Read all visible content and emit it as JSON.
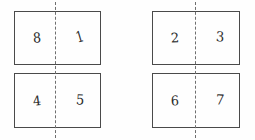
{
  "figure": {
    "type": "symmetry-diagram",
    "background_color": "#fefefe",
    "stroke_color": "#4a4a4a",
    "dash_color": "#6f6f6f",
    "digit_color": "#2b2b2b",
    "groups": [
      {
        "name": "left-group",
        "fold_line_x": 55,
        "panels": [
          {
            "name": "top-left-panel",
            "left_cell": {
              "label": "8"
            },
            "right_cell": {
              "label": "1"
            }
          },
          {
            "name": "bottom-left-panel",
            "left_cell": {
              "label": "4"
            },
            "right_cell": {
              "label": "5"
            }
          }
        ]
      },
      {
        "name": "right-group",
        "fold_line_x": 195,
        "panels": [
          {
            "name": "top-right-panel",
            "left_cell": {
              "label": "2"
            },
            "right_cell": {
              "label": "3"
            }
          },
          {
            "name": "bottom-right-panel",
            "left_cell": {
              "label": "6"
            },
            "right_cell": {
              "label": "7"
            }
          }
        ]
      }
    ]
  }
}
